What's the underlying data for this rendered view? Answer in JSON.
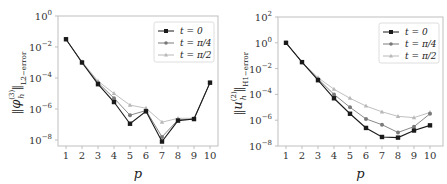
{
  "colors": {
    "t0": "#1a1a1a",
    "tpi4": "#7a7a7a",
    "tpi2": "#b8b8b8",
    "axis": "#bfbfbf",
    "text": "#333333"
  },
  "chart_data": [
    {
      "type": "line",
      "title": "",
      "xlabel": "p",
      "ylabel": "||φ_h^(3)||_{L2-error}",
      "yscale": "log",
      "ylim": [
        1e-09,
        1
      ],
      "yticks": [
        "10^0",
        "10^-2",
        "10^-4",
        "10^-6",
        "10^-8"
      ],
      "x": [
        1,
        2,
        3,
        4,
        5,
        6,
        7,
        8,
        9,
        10
      ],
      "xticks": [
        "1",
        "2",
        "3",
        "4",
        "5",
        "6",
        "7",
        "8",
        "9",
        "10"
      ],
      "legend_position": "upper right",
      "grid": false,
      "series": [
        {
          "name": "t = 0",
          "marker": "square",
          "log10_values": [
            -1.5,
            -3.0,
            -4.4,
            -5.55,
            -6.95,
            -6.15,
            -8.1,
            -6.75,
            -6.65,
            -4.3
          ]
        },
        {
          "name": "t = π/4",
          "marker": "circle",
          "log10_values": [
            -1.5,
            -3.0,
            -4.3,
            -5.3,
            -6.4,
            -6.1,
            -7.8,
            -6.7,
            -6.65,
            -4.3
          ]
        },
        {
          "name": "t = π/2",
          "marker": "triangle",
          "log10_values": [
            -1.5,
            -2.95,
            -4.2,
            -5.0,
            -5.75,
            -5.95,
            -6.85,
            -6.6,
            -6.6,
            -4.3
          ]
        }
      ]
    },
    {
      "type": "line",
      "title": "",
      "xlabel": "p",
      "ylabel": "||u_h^(2)||_{H1-error}",
      "yscale": "log",
      "ylim": [
        1e-08,
        100
      ],
      "yticks": [
        "10^2",
        "10^0",
        "10^-2",
        "10^-4",
        "10^-6",
        "10^-8"
      ],
      "x": [
        1,
        2,
        3,
        4,
        5,
        6,
        7,
        8,
        9,
        10
      ],
      "xticks": [
        "1",
        "2",
        "3",
        "4",
        "5",
        "6",
        "7",
        "8",
        "9",
        "10"
      ],
      "legend_position": "upper right",
      "grid": false,
      "series": [
        {
          "name": "t = 0",
          "marker": "square",
          "log10_values": [
            0.0,
            -1.5,
            -2.9,
            -4.3,
            -5.5,
            -6.6,
            -7.3,
            -7.35,
            -6.8,
            -6.4
          ]
        },
        {
          "name": "t = π/4",
          "marker": "circle",
          "log10_values": [
            0.0,
            -1.5,
            -2.8,
            -4.0,
            -5.0,
            -5.9,
            -6.35,
            -6.95,
            -6.5,
            -5.5
          ]
        },
        {
          "name": "t = π/2",
          "marker": "triangle",
          "log10_values": [
            0.0,
            -1.5,
            -2.7,
            -3.6,
            -4.3,
            -4.9,
            -5.35,
            -5.7,
            -5.8,
            -5.4
          ]
        }
      ]
    }
  ],
  "charts": [
    {
      "xlabel": "p",
      "ylabel_main": "φ",
      "ylabel_sub": "h",
      "ylabel_sup": "(3)",
      "ylabel_norm": "L2−error",
      "ytick_exps": [
        "0",
        "−2",
        "−4",
        "−6",
        "−8"
      ],
      "legend": [
        "t = 0",
        "t = π/4",
        "t = π/2"
      ]
    },
    {
      "xlabel": "p",
      "ylabel_main": "u",
      "ylabel_sub": "h",
      "ylabel_sup": "(2)",
      "ylabel_norm": "H1−error",
      "ytick_exps": [
        "2",
        "0",
        "−2",
        "−4",
        "−6",
        "−8"
      ],
      "legend": [
        "t = 0",
        "t = π/4",
        "t = π/2"
      ]
    }
  ]
}
